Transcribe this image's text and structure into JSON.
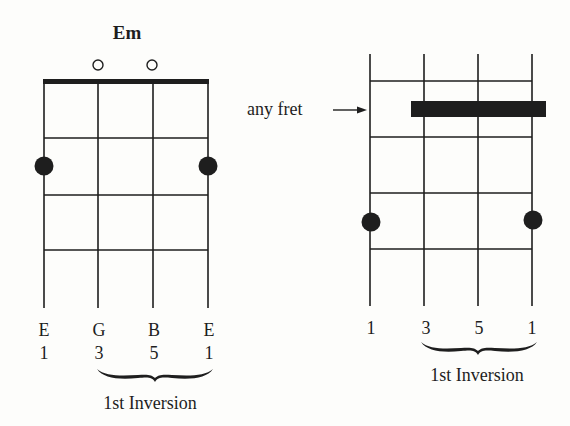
{
  "left_diagram": {
    "chord_name": "Em",
    "open_strings": [
      1,
      2
    ],
    "string_notes": [
      "E",
      "G",
      "B",
      "E"
    ],
    "string_degrees": [
      "1",
      "3",
      "5",
      "1"
    ],
    "brace_label": "1st Inversion",
    "dots": [
      {
        "string": 0,
        "fret": 2
      },
      {
        "string": 3,
        "fret": 2
      }
    ],
    "has_nut": true
  },
  "right_diagram": {
    "annotation": "any fret",
    "string_degrees": [
      "1",
      "3",
      "5",
      "1"
    ],
    "brace_label": "1st Inversion",
    "barre": {
      "from_string": 1,
      "to_string": 3,
      "fret": 1
    },
    "dots": [
      {
        "string": 0,
        "fret": 3
      },
      {
        "string": 3,
        "fret": 3
      }
    ],
    "has_nut": false
  },
  "colors": {
    "ink": "#1e1e1e",
    "background": "#fdfdfb"
  }
}
